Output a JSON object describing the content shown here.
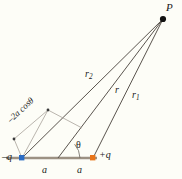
{
  "figure": {
    "background_color": "#fdfdf7",
    "labels": {
      "point_p": "P",
      "r2": "r",
      "r2_sub": "2",
      "r": "r",
      "r1": "r",
      "r1_sub": "1",
      "negative_charge": "–q",
      "positive_charge": "+q",
      "half_separation_left": "a",
      "half_separation_right": "a",
      "angle": "θ",
      "path_difference": "–2a cosθ"
    },
    "colors": {
      "negative_charge_dot": "#2b6cc4",
      "positive_charge_dot": "#e8751a",
      "axis_line": "#9c9183",
      "ray_line": "#58524c",
      "construction_line": "#a8a29a",
      "point_dot": "#111111",
      "text": "#1a1a1a"
    },
    "geometry": {
      "point_p": {
        "x": 163,
        "y": 19
      },
      "negative_charge": {
        "x": 22,
        "y": 158
      },
      "origin": {
        "x": 58,
        "y": 158
      },
      "positive_charge": {
        "x": 93,
        "y": 158
      },
      "foot_point": {
        "x": 48,
        "y": 110
      },
      "projection_point": {
        "x": 14,
        "y": 139
      },
      "axis_start": {
        "x": 6,
        "y": 158
      },
      "axis_end": {
        "x": 97,
        "y": 158
      }
    }
  }
}
